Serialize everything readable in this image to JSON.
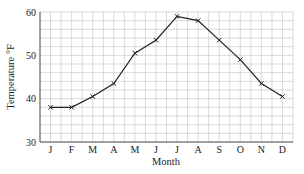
{
  "chart_data": {
    "type": "line",
    "title": "",
    "xlabel": "Month",
    "ylabel": "Temperature °F",
    "categories": [
      "J",
      "F",
      "M",
      "A",
      "M",
      "J",
      "J",
      "A",
      "S",
      "O",
      "N",
      "D"
    ],
    "series": [
      {
        "name": "Temperature",
        "values": [
          38,
          38,
          40.5,
          43.5,
          50.5,
          53.5,
          59,
          58,
          53.5,
          49,
          43.5,
          40.5
        ],
        "marker": "x",
        "color": "#222222"
      }
    ],
    "ylim": [
      30,
      60
    ],
    "yticks": [
      30,
      40,
      50,
      60
    ],
    "grid": true,
    "grid_minor_y_step": 2,
    "legend": null
  },
  "colors": {
    "grid": "#c8c8c8",
    "axis": "#555555",
    "line": "#222222"
  }
}
